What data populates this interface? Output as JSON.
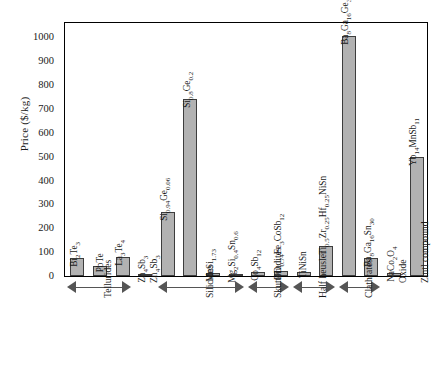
{
  "chart_data": {
    "type": "bar",
    "title": "",
    "xlabel": "",
    "ylabel": "Price ($/kg)",
    "ylim": [
      0,
      1060
    ],
    "ytick_values": [
      0,
      100,
      200,
      300,
      400,
      500,
      600,
      700,
      800,
      900,
      1000
    ],
    "ytick_labels": [
      "0",
      "100",
      "200",
      "300",
      "400",
      "500",
      "600",
      "700",
      "800",
      "900",
      "1000"
    ],
    "minor_tick_step": 20,
    "grid": false,
    "legend": null,
    "bar_color": "#b2b2b2",
    "bar_edge_color": "#3d3d3d",
    "categories": [
      "Bi2Te3",
      "PbTe",
      "La3Te4",
      "Zn4Sb3",
      "Si0.94Ge0.06",
      "Si0.8Ge0.2",
      "MnSi1.73",
      "Mg2Si0.4Sn0.6",
      "Co4Sb12",
      "DD0.74Fe3CoSb12",
      "TiNiSn",
      "Ti0.5Zr0.25Hf0.25NiSn",
      "Ba8Ga16Ge30",
      "Ba8Ga16Sn30",
      "NaCo2O4",
      "Yb14MnSb11"
    ],
    "values": [
      75,
      40,
      80,
      5,
      270,
      740,
      12,
      8,
      15,
      20,
      18,
      125,
      1005,
      75,
      12,
      500
    ],
    "labels_html": [
      "Bi<sub>2</sub>Te<sub>3</sub>",
      "PbTe",
      "La<sub>3</sub>Te<sub>4</sub>",
      "Zn<sub>4</sub>Sb<sub>3</sub>",
      "Si<sub>0.94</sub>Ge<sub>0.06</sub>",
      "Si<sub>0.8</sub>Ge<sub>0.2</sub>",
      "MnSi<sub>1.73</sub>",
      "Mg<sub>2</sub>Si<sub>0.4</sub>Sn<sub>0.6</sub>",
      "Co<sub>4</sub>Sb<sub>12</sub>",
      "DD<sub>0.74</sub>Fe<sub>3</sub>CoSb<sub>12</sub>",
      "TiNiSn",
      "Ti<sub>0.5</sub>Zr<sub>0.25</sub>Hf<sub>0.25</sub>NiSn",
      "Ba<sub>8</sub>Ga<sub>16</sub>Ge<sub>30</sub>",
      "Ba<sub>8</sub>Ga<sub>16</sub>Sn<sub>30</sub>",
      "NaCo<sub>2</sub>O<sub>4</sub>",
      "Yb<sub>14</sub>MnSb<sub>11</sub>"
    ],
    "groups": [
      {
        "name": "Tellurides",
        "label_html": "Tellurides",
        "start": 0,
        "end": 2,
        "bracket": true
      },
      {
        "name": "Zn4Sb3",
        "label_html": "Zn<sub>4</sub>Sb<sub>3</sub>",
        "start": 3,
        "end": 3,
        "bracket": false
      },
      {
        "name": "Silicides",
        "label_html": "Silicides",
        "start": 4,
        "end": 7,
        "bracket": true
      },
      {
        "name": "Skutterudites",
        "label_html": "Skutterudites",
        "start": 8,
        "end": 9,
        "bracket": true
      },
      {
        "name": "Half heusler",
        "label_html": "Half heusler",
        "start": 10,
        "end": 11,
        "bracket": true
      },
      {
        "name": "Clathrates",
        "label_html": "Clathrates",
        "start": 12,
        "end": 13,
        "bracket": true
      },
      {
        "name": "Oxide",
        "label_html": "Oxide",
        "start": 14,
        "end": 14,
        "bracket": false
      },
      {
        "name": "Zintl compound",
        "label_html": "Zintl compound",
        "start": 15,
        "end": 15,
        "bracket": false
      }
    ]
  }
}
